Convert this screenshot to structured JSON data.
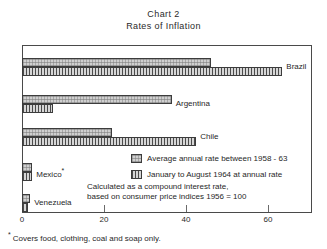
{
  "chart_data": {
    "type": "bar",
    "orientation": "horizontal",
    "title": "Chart 2",
    "subtitle": "Rates of Inflation",
    "xlabel": "",
    "ylabel": "",
    "xlim": [
      0,
      70
    ],
    "x_ticks": [
      0,
      20,
      40,
      60
    ],
    "x_tick_labels": [
      "0",
      "20",
      "40",
      "60"
    ],
    "grid": false,
    "legend_position": "inside-right",
    "categories": [
      "Brazil",
      "Argentina",
      "Chile",
      "Mexico",
      "Venezuela"
    ],
    "series": [
      {
        "name": "Average annual rate between 1958 - 63",
        "values": [
          46,
          36.5,
          22,
          2.5,
          2
        ]
      },
      {
        "name": "January to August 1964 at annual rate",
        "values": [
          63.5,
          7.5,
          42.5,
          2.5,
          1.5
        ]
      }
    ],
    "annotations": [
      "Calculated as a compound interest rate,",
      "based on consumer price indices 1956 = 100"
    ],
    "footnote": "Covers food, clothing, coal and soap only."
  },
  "titles": {
    "line1": "Chart 2",
    "line2": "Rates of Inflation"
  },
  "axis": {
    "ticks": [
      {
        "label": "0",
        "value": 0
      },
      {
        "label": "20",
        "value": 20
      },
      {
        "label": "40",
        "value": 40
      },
      {
        "label": "60",
        "value": 60
      }
    ]
  },
  "bars": [
    {
      "country": "Brazil",
      "label": "Brazil",
      "star": "",
      "avg": 46,
      "jan": 63.5
    },
    {
      "country": "Argentina",
      "label": "Argentina",
      "star": "",
      "avg": 36.5,
      "jan": 7.5
    },
    {
      "country": "Chile",
      "label": "Chile",
      "star": "",
      "avg": 22,
      "jan": 42.5
    },
    {
      "country": "Mexico",
      "label": "Mexico",
      "star": "*",
      "avg": 2.5,
      "jan": 2.5
    },
    {
      "country": "Venezuela",
      "label": "Venezuela",
      "star": "",
      "avg": 2,
      "jan": 1.5
    }
  ],
  "legend": {
    "items": [
      {
        "swatch": "average-rate-swatch",
        "text": "Average annual rate between 1958 - 63"
      },
      {
        "swatch": "january-august-swatch",
        "text": "January to August 1964 at annual rate"
      }
    ]
  },
  "note": {
    "line1": "Calculated as a compound interest rate,",
    "line2": "based on consumer price indices 1956 = 100"
  },
  "footnote": {
    "star": "*",
    "text": "Covers food, clothing, coal and soap only."
  },
  "colors": {
    "frame": "#4a4a4a",
    "bar_outline": "#3c3c3c",
    "avg_fill": "#cfcfcf",
    "jan_fill": "#d6d6d6",
    "text": "#1f1f1f"
  }
}
